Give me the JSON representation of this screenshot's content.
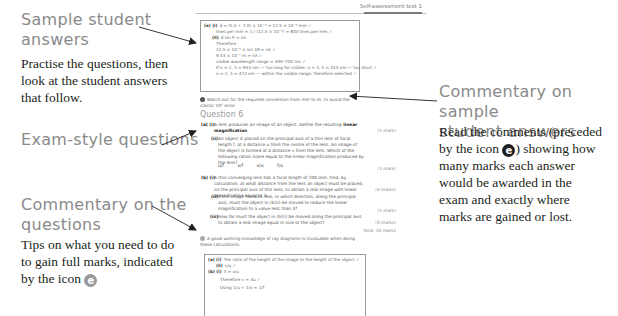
{
  "annotations": {
    "sample_answers": {
      "heading_line1": "Sample student",
      "heading_line2": "answers",
      "body_line1": "Practise the questions, then",
      "body_line2": "look at the student answers",
      "body_line3": "that follow."
    },
    "exam_questions": {
      "heading": "Exam-style questions"
    },
    "commentary_questions": {
      "heading_line1": "Commentary on the",
      "heading_line2": "questions",
      "body_line1": "Tips on what you need to do",
      "body_line2": "to gain full marks, indicated",
      "body_line3": "by the icon",
      "icon": "e-icon"
    },
    "commentary_answers": {
      "heading_line1": "Commentary on sample",
      "heading_line2": "student answers",
      "body_line1": "Read the comments (preceded",
      "body_line2_a": "by the icon",
      "body_line2_b": ") showing how",
      "body_line3": "many marks each answer",
      "body_line4": "would be awarded in the",
      "body_line5": "exam and exactly where",
      "body_line6": "marks are gained or lost.",
      "icon": "e-icon"
    }
  },
  "page": {
    "header_title": "Self-assessment test 1",
    "top_answer": {
      "lines": [
        {
          "label": "(e) (i)",
          "text": "d = (5.5 + 7.0) × 10⁻³ = 12.5 × 10⁻³ mm ✓"
        },
        {
          "label": "",
          "text": "lines per mm = 1 / (12.5 × 10⁻³) = 800 lines per mm ✓"
        },
        {
          "label": "(ii)",
          "text": "d sin θ = nλ"
        },
        {
          "label": "",
          "text": "Therefore"
        },
        {
          "label": "",
          "text": "12.5 × 10⁻³ × sin 49 = nλ ✓"
        },
        {
          "label": "",
          "text": "9.43 × 10⁻⁷ m = nλ ✓"
        },
        {
          "label": "",
          "text": "visible wavelength range = 400–700 nm ✓"
        },
        {
          "label": "",
          "text": "If n = 1, λ = 943 nm — too long for visible; n = 3, λ = 314 nm — too short ✓"
        },
        {
          "label": "",
          "text": "n = 2, λ = 472 nm — within the visible range, therefore selected ✓"
        }
      ]
    },
    "tip1": "Watch out for the required conversion from mm to m, to avoid the classic 10³ error.",
    "question_title": "Question 6",
    "questions": [
      {
        "label": "(a) (i)",
        "text_a": "A lens produces an image of an object. Define the resulting ",
        "text_bold": "linear magnification",
        "text_b": ".",
        "marks": "(1 mark)"
      },
      {
        "label": "(ii)",
        "text": "An object is placed on the principal axis of a thin lens of focal length f, at a distance u from the centre of the lens. An image of the object is formed at a distance v from the lens. Which of the following ratios is/are equal to the linear magnification produced by the lens?",
        "marks": "(1 mark)"
      },
      {
        "label": "(b) (i)",
        "text": "A thin converging lens has a focal length of 200 mm. Find, by calculation, at what distance from the lens an object must be placed, on the principal axis of this lens, to obtain a real image with linear magnification equal to 3.",
        "marks": "(4 marks)"
      },
      {
        "label": "(ii)",
        "text": "If the image remains real, in which direction, along the principal axis, must the object in (b)(i) be moved to reduce the linear magnification to a value less than 3?",
        "marks": "(1 mark)"
      },
      {
        "label": "(iii)",
        "text": "How far must the object in (b)(i) be moved along the principal axis to obtain a real image equal in size to the object?",
        "marks": "(3 marks)"
      }
    ],
    "fractions": [
      "u/f",
      "v/f",
      "v/u",
      "f/u"
    ],
    "total_marks": "Total: 10 marks",
    "tip2": "A good working knowledge of ray diagrams is invaluable when doing these calculations.",
    "bottom_answer": {
      "lines": [
        {
          "label": "(a) (i)",
          "text": "The ratio of the height of the image to the height of the object ✓"
        },
        {
          "label": "(ii)",
          "text": "v/u ✓"
        },
        {
          "label": "(b) (i)",
          "text": "3 = v/u"
        },
        {
          "label": "",
          "text": "Therefore v = 3u ✓"
        },
        {
          "label": "",
          "text": "Using 1/u + 1/v = 1/f"
        }
      ]
    }
  },
  "colors": {
    "heading_grey": "#8a8a8a",
    "body_text": "#231f20",
    "icon_grey": "#9a9a9a",
    "icon_dark": "#231f20"
  }
}
